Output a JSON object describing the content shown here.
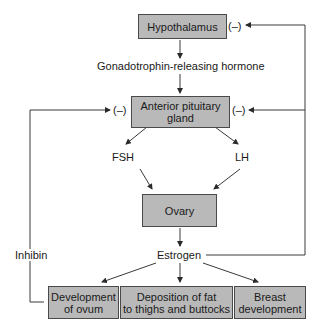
{
  "diagram": {
    "nodes": {
      "hypothalamus": "Hypothalamus",
      "anterior_pituitary_line1": "Anterior pituitary",
      "anterior_pituitary_line2": "gland",
      "ovary": "Ovary",
      "development_ovum_line1": "Development",
      "development_ovum_line2": "of ovum",
      "deposition_fat_line1": "Deposition of fat",
      "deposition_fat_line2": "to thighs and buttocks",
      "breast_line1": "Breast",
      "breast_line2": "development"
    },
    "labels": {
      "gnrh": "Gonadotrophin-releasing hormone",
      "fsh": "FSH",
      "lh": "LH",
      "estrogen": "Estrogen",
      "inhibin": "Inhibin",
      "neg_hypothalamus": "(–)",
      "neg_pituitary_left": "(–)",
      "neg_pituitary_right": "(–)"
    },
    "colors": {
      "box_fill": "#b9b9b9",
      "line": "#3a3a3a"
    }
  }
}
